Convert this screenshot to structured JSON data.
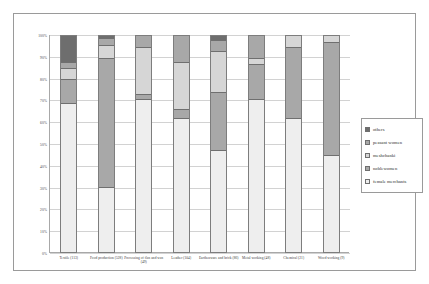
{
  "chart_data": {
    "type": "bar",
    "subtype": "stacked-100-percent",
    "title": "",
    "xlabel": "",
    "ylabel": "",
    "ylim": [
      0,
      100
    ],
    "ytick_labels": [
      "100%",
      "90%",
      "80%",
      "70%",
      "60%",
      "50%",
      "40%",
      "30%",
      "20%",
      "10%",
      "0%"
    ],
    "ytick_values": [
      100,
      90,
      80,
      70,
      60,
      50,
      40,
      30,
      20,
      10,
      0
    ],
    "grid": true,
    "legend_position": "right",
    "categories": [
      "Textile (113)",
      "Food production (528)",
      "Processing of flax and wax (49)",
      "Leather (104)",
      "Earthenware and brick (86)",
      "Metal working (48)",
      "Chemical (21)",
      "Wood working (9)"
    ],
    "series": [
      {
        "name": "female merchants",
        "color": "#eeeeee",
        "values": [
          69,
          30,
          71,
          62,
          47,
          71,
          62,
          45
        ]
      },
      {
        "name": "noblewomen",
        "color": "#a8a8a8",
        "values": [
          11,
          60,
          2,
          4,
          27,
          16,
          33,
          52
        ]
      },
      {
        "name": "meshchanki",
        "color": "#d6d6d6",
        "values": [
          5,
          6,
          22,
          22,
          19,
          3,
          5,
          3
        ]
      },
      {
        "name": "peasant women",
        "color": "#a8a8a8",
        "values": [
          3,
          3,
          5,
          12,
          5,
          10,
          0,
          0
        ]
      },
      {
        "name": "others",
        "color": "#6e6e6e",
        "values": [
          12,
          1,
          0,
          0,
          2,
          0,
          0,
          0
        ]
      }
    ]
  },
  "legend": {
    "items": [
      {
        "label": "others",
        "color": "#6e6e6e"
      },
      {
        "label": "peasant women",
        "color": "#a8a8a8"
      },
      {
        "label": "meshchanki",
        "color": "#d6d6d6"
      },
      {
        "label": "noblewomen",
        "color": "#a8a8a8"
      },
      {
        "label": "female merchants",
        "color": "#eeeeee"
      }
    ]
  }
}
